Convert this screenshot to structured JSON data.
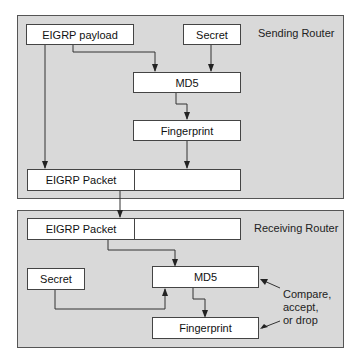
{
  "sending": {
    "title": "Sending Router",
    "payload": "EIGRP payload",
    "secret": "Secret",
    "md5": "MD5",
    "fingerprint": "Fingerprint",
    "packet": "EIGRP Packet"
  },
  "receiving": {
    "title": "Receiving Router",
    "packet": "EIGRP Packet",
    "secret": "Secret",
    "md5": "MD5",
    "fingerprint": "Fingerprint",
    "note_line1": "Compare,",
    "note_line2": "accept,",
    "note_line3": "or drop"
  },
  "colors": {
    "panel": "#d9d9d9",
    "box": "#ffffff",
    "line": "#333333"
  }
}
